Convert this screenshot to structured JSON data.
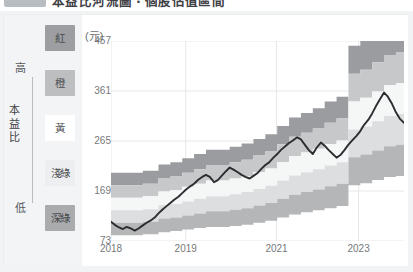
{
  "title_bar": {
    "chip_label": "",
    "text": "本益比河流圖 ‧ 個股估值區間"
  },
  "legend": {
    "axis_top_label": "高",
    "axis_bottom_label": "低",
    "axis_title": "本益比",
    "axis_title_chars": [
      "本",
      "益",
      "比"
    ],
    "items": [
      {
        "label": "紅",
        "key": "red",
        "color": "#9c9ea1",
        "text_color": "#4a4c4f"
      },
      {
        "label": "橙",
        "key": "orange",
        "color": "#bcbec0",
        "text_color": "#4e5053"
      },
      {
        "label": "黃",
        "key": "yellow",
        "color": "#ffffff",
        "text_color": "#4e5053"
      },
      {
        "label": "淺綠",
        "key": "light-green",
        "color": "#eceeef",
        "text_color": "#4e5053"
      },
      {
        "label": "深綠",
        "key": "dark-green",
        "color": "#a9abad",
        "text_color": "#45474a"
      }
    ]
  },
  "chart_data": {
    "type": "area",
    "title": "",
    "subtitle": "",
    "unit_label": "(元)",
    "xlabel": "",
    "ylabel": "",
    "ylim": [
      73,
      457
    ],
    "yticks": [
      73,
      169,
      265,
      361,
      457
    ],
    "xticks": [
      "2018",
      "2019",
      "2021",
      "2023"
    ],
    "xtick_positions": [
      0.0,
      0.255,
      0.565,
      0.845
    ],
    "grid": true,
    "legend_position": "left",
    "stacked": true,
    "x": [
      2018.0,
      2018.08,
      2018.17,
      2018.25,
      2018.33,
      2018.42,
      2018.5,
      2018.58,
      2018.67,
      2018.75,
      2018.83,
      2018.92,
      2019.0,
      2019.08,
      2019.17,
      2019.25,
      2019.33,
      2019.42,
      2019.5,
      2019.58,
      2019.67,
      2019.75,
      2019.83,
      2019.92,
      2020.0,
      2020.08,
      2020.17,
      2020.25,
      2020.33,
      2020.42,
      2020.5,
      2020.58,
      2020.67,
      2020.75,
      2020.83,
      2020.92,
      2021.0,
      2021.08,
      2021.17,
      2021.25,
      2021.33,
      2021.42,
      2021.5,
      2021.58,
      2021.67,
      2021.75,
      2021.83,
      2021.92,
      2022.0,
      2022.08,
      2022.17,
      2022.25,
      2022.33,
      2022.42,
      2022.5,
      2022.58,
      2022.67,
      2022.75,
      2022.83,
      2022.92,
      2023.0,
      2023.08,
      2023.17,
      2023.25,
      2023.33,
      2023.42,
      2023.5,
      2023.58,
      2023.67,
      2023.75,
      2023.83,
      2023.92,
      2024.0,
      2024.08,
      2024.17
    ],
    "series": [
      {
        "name": "價格",
        "key": "price-line",
        "type": "line",
        "color": "#2b2d30",
        "values": [
          110,
          104,
          99,
          96,
          100,
          97,
          93,
          97,
          103,
          108,
          112,
          118,
          126,
          133,
          140,
          146,
          152,
          158,
          165,
          172,
          178,
          183,
          190,
          196,
          200,
          196,
          186,
          190,
          198,
          207,
          214,
          210,
          205,
          200,
          196,
          193,
          198,
          203,
          212,
          219,
          224,
          233,
          240,
          248,
          255,
          261,
          266,
          272,
          268,
          258,
          247,
          240,
          252,
          262,
          256,
          248,
          240,
          233,
          238,
          248,
          258,
          266,
          275,
          284,
          296,
          306,
          318,
          332,
          346,
          358,
          350,
          336,
          320,
          308,
          300
        ]
      },
      {
        "name": "深綠下界",
        "key": "band-dark-green-lower",
        "type": "band_boundary",
        "color": "#ffffff",
        "values": [
          84,
          84,
          84,
          84,
          84,
          84,
          84,
          84,
          86,
          86,
          86,
          86,
          90,
          90,
          90,
          92,
          92,
          92,
          95,
          95,
          95,
          98,
          98,
          98,
          100,
          100,
          100,
          100,
          100,
          100,
          102,
          102,
          102,
          104,
          104,
          104,
          108,
          108,
          108,
          112,
          112,
          112,
          118,
          118,
          118,
          124,
          124,
          124,
          128,
          128,
          128,
          132,
          132,
          132,
          136,
          136,
          136,
          140,
          140,
          140,
          180,
          180,
          180,
          184,
          184,
          184,
          190,
          190,
          190,
          196,
          196,
          196,
          198,
          198,
          198
        ]
      },
      {
        "name": "深綠",
        "key": "band-dark-green",
        "type": "band",
        "color": "#b4b6b8",
        "values": [
          108,
          108,
          108,
          108,
          108,
          108,
          108,
          108,
          110,
          110,
          110,
          110,
          116,
          116,
          116,
          118,
          118,
          118,
          122,
          122,
          122,
          126,
          126,
          126,
          130,
          130,
          130,
          130,
          130,
          130,
          133,
          133,
          133,
          136,
          136,
          136,
          141,
          141,
          141,
          146,
          146,
          146,
          154,
          154,
          154,
          162,
          162,
          162,
          167,
          167,
          167,
          172,
          172,
          172,
          178,
          178,
          178,
          183,
          183,
          183,
          234,
          234,
          234,
          239,
          239,
          239,
          247,
          247,
          247,
          255,
          255,
          255,
          258,
          258,
          258
        ]
      },
      {
        "name": "淺綠",
        "key": "band-light-green",
        "type": "band",
        "color": "#dcdedf",
        "values": [
          132,
          132,
          132,
          132,
          132,
          132,
          132,
          132,
          134,
          134,
          134,
          134,
          142,
          142,
          142,
          144,
          144,
          144,
          149,
          149,
          149,
          154,
          154,
          154,
          159,
          159,
          159,
          159,
          159,
          159,
          163,
          163,
          163,
          167,
          167,
          167,
          173,
          173,
          173,
          179,
          179,
          179,
          189,
          189,
          189,
          199,
          199,
          199,
          205,
          205,
          205,
          211,
          211,
          211,
          218,
          218,
          218,
          224,
          224,
          224,
          287,
          287,
          287,
          293,
          293,
          293,
          303,
          303,
          303,
          313,
          313,
          313,
          317,
          317,
          317
        ]
      },
      {
        "name": "黃",
        "key": "band-yellow",
        "type": "band",
        "color": "#f5f6f6",
        "values": [
          156,
          156,
          156,
          156,
          156,
          156,
          156,
          156,
          159,
          159,
          159,
          159,
          168,
          168,
          168,
          171,
          171,
          171,
          177,
          177,
          177,
          183,
          183,
          183,
          189,
          189,
          189,
          189,
          189,
          189,
          193,
          193,
          193,
          198,
          198,
          198,
          205,
          205,
          205,
          212,
          212,
          212,
          224,
          224,
          224,
          236,
          236,
          236,
          243,
          243,
          243,
          250,
          250,
          250,
          259,
          259,
          259,
          266,
          266,
          266,
          341,
          341,
          341,
          348,
          348,
          348,
          360,
          360,
          360,
          372,
          372,
          372,
          376,
          376,
          376
        ]
      },
      {
        "name": "橙",
        "key": "band-orange",
        "type": "band",
        "color": "#c6c8ca",
        "values": [
          180,
          180,
          180,
          180,
          180,
          180,
          180,
          180,
          183,
          183,
          183,
          183,
          194,
          194,
          194,
          197,
          197,
          197,
          204,
          204,
          204,
          211,
          211,
          211,
          218,
          218,
          218,
          218,
          218,
          218,
          224,
          224,
          224,
          229,
          229,
          229,
          237,
          237,
          237,
          245,
          245,
          245,
          259,
          259,
          259,
          273,
          273,
          273,
          281,
          281,
          281,
          289,
          289,
          289,
          300,
          300,
          300,
          308,
          308,
          308,
          394,
          394,
          394,
          402,
          402,
          402,
          416,
          416,
          416,
          430,
          430,
          430,
          435,
          435,
          435
        ]
      },
      {
        "name": "紅",
        "key": "band-red",
        "type": "band",
        "color": "#9a9c9f",
        "values": [
          204,
          204,
          204,
          204,
          204,
          204,
          204,
          204,
          208,
          208,
          208,
          208,
          220,
          220,
          220,
          224,
          224,
          224,
          232,
          232,
          232,
          240,
          240,
          240,
          248,
          248,
          248,
          248,
          248,
          248,
          254,
          254,
          254,
          260,
          260,
          260,
          269,
          269,
          269,
          278,
          278,
          278,
          294,
          294,
          294,
          310,
          310,
          310,
          319,
          319,
          319,
          328,
          328,
          328,
          341,
          341,
          341,
          350,
          350,
          350,
          448,
          448,
          448,
          457,
          457,
          457,
          473,
          473,
          473,
          489,
          489,
          489,
          494,
          494,
          494
        ]
      }
    ]
  }
}
